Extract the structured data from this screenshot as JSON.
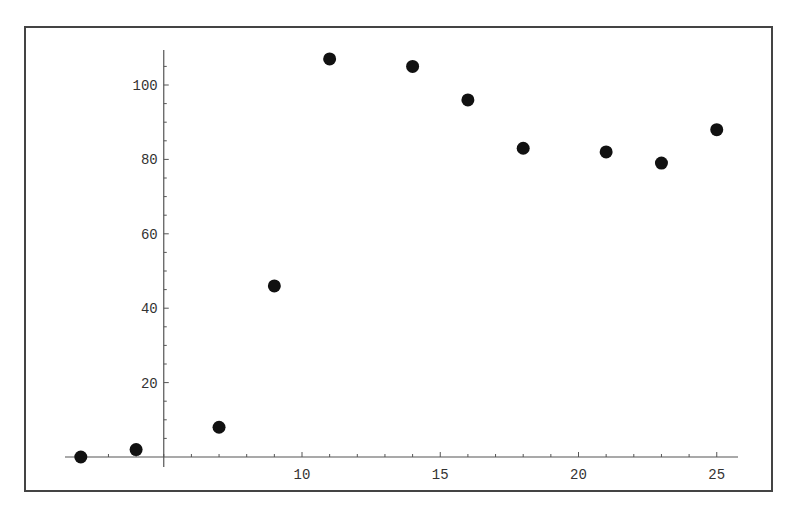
{
  "chart_data": {
    "type": "scatter",
    "title": "",
    "xlabel": "",
    "ylabel": "",
    "x": [
      2,
      4,
      7,
      9,
      11,
      14,
      16,
      18,
      21,
      23,
      25
    ],
    "y": [
      0,
      2,
      8,
      46,
      107,
      105,
      96,
      83,
      82,
      79,
      88
    ],
    "series": [
      {
        "name": "data",
        "x": [
          2,
          4,
          7,
          9,
          11,
          14,
          16,
          18,
          21,
          23,
          25
        ],
        "values": [
          0,
          2,
          8,
          46,
          107,
          105,
          96,
          83,
          82,
          79,
          88
        ]
      }
    ],
    "xlim": [
      1.3,
      25.5
    ],
    "ylim": [
      -2,
      110
    ],
    "axes_origin": [
      5,
      0
    ],
    "x_ticks": [
      10,
      15,
      20,
      25
    ],
    "x_tick_labels": [
      "10",
      "15",
      "20",
      "25"
    ],
    "y_ticks": [
      20,
      40,
      60,
      80,
      100
    ],
    "y_tick_labels": [
      "20",
      "40",
      "60",
      "80",
      "100"
    ],
    "grid": false,
    "legend": "none",
    "frame": true,
    "marker_color": "#111111",
    "axis_color": "#555555"
  }
}
